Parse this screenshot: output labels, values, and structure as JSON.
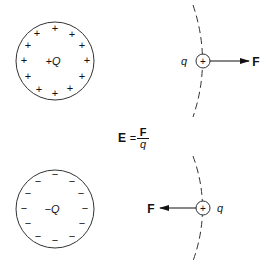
{
  "top": {
    "sphere_label": "+Q",
    "surface_charge": "+",
    "test_charge_sign": "+",
    "test_charge_label": "q",
    "force_label": "F"
  },
  "equation": {
    "lhs": "E",
    "eq": "=",
    "numerator": "F",
    "denominator": "q"
  },
  "bottom": {
    "sphere_label": "−Q",
    "surface_charge": "−",
    "test_charge_sign": "+",
    "test_charge_label": "q",
    "force_label": "F"
  },
  "colors": {
    "line": "#333333",
    "text": "#111111"
  }
}
